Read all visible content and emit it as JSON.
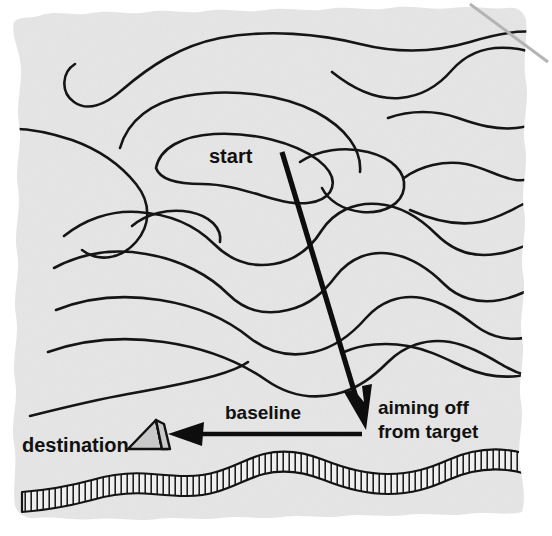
{
  "figure": {
    "medium": "scanned paper illustration",
    "paper_color": "#e6e6e6",
    "ink_color": "#131313",
    "tent_fill": "#c9c9c9"
  },
  "labels": {
    "start": "start",
    "destination": "destination",
    "baseline": "baseline",
    "aiming_off_line1": "aiming off",
    "aiming_off_line2": "from target"
  },
  "icons": {
    "tent": "tent-icon",
    "travel_arrow": "travel-arrow-icon",
    "baseline_arrow": "baseline-arrow-icon",
    "ridge": "escarpment-hachure-icon"
  },
  "map_features": {
    "contour_lines_count": 16,
    "escarpment_label": "hachured ridge"
  }
}
